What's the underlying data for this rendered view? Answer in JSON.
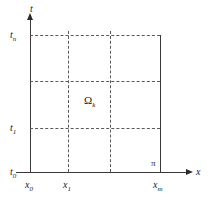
{
  "figure": {
    "type": "grid-domain-diagram",
    "axes": {
      "x_axis_label": "x",
      "t_axis_label": "t"
    },
    "t_ticks": [
      {
        "id": "t_n",
        "base": "t",
        "sub": "n",
        "y": 35
      },
      {
        "id": "t_1",
        "base": "t",
        "sub": "1",
        "y": 128
      },
      {
        "id": "t_0",
        "base": "t",
        "sub": "0",
        "y": 172
      }
    ],
    "x_ticks": [
      {
        "id": "x_0",
        "base": "x",
        "sub": "0",
        "x": 30
      },
      {
        "id": "x_1",
        "base": "x",
        "sub": "1",
        "x": 68
      },
      {
        "id": "x_m",
        "base": "x",
        "sub": "m",
        "x": 160
      }
    ],
    "boundary_label": "π",
    "domain_label": {
      "base": "Ω",
      "sub": "k"
    },
    "grid": {
      "horizontal_dashed_y": [
        35,
        81,
        128
      ],
      "vertical_dashed_x": [
        68,
        110
      ],
      "left_x": 30,
      "right_x": 160,
      "bottom_y": 172,
      "top_y": 35
    },
    "colors": {
      "line": "#3a3a3a",
      "dash": "#5a5a5a",
      "text": "#1d1d1d",
      "background": "#ffffff"
    }
  }
}
